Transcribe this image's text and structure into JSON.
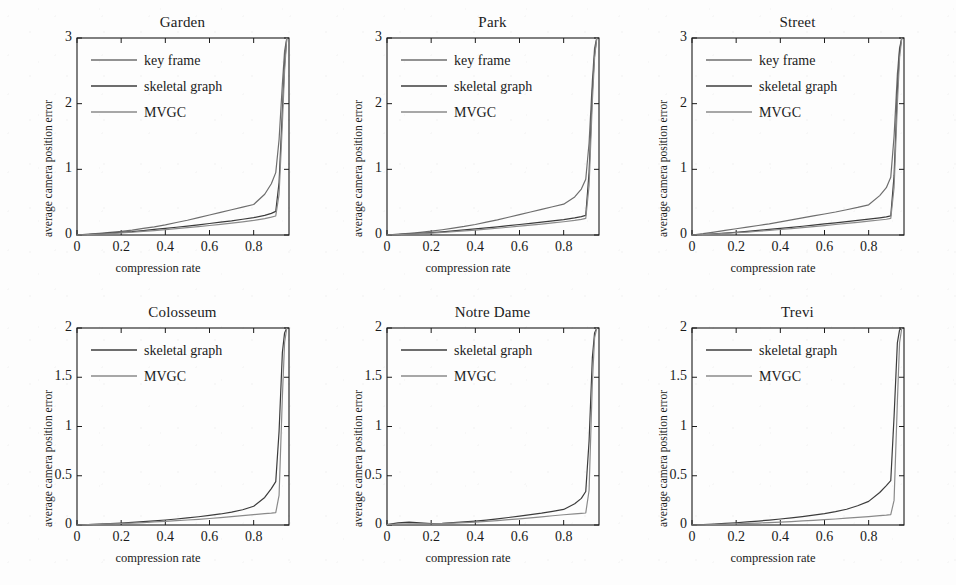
{
  "figure": {
    "background": "#fdfdfd",
    "axis_color": "#1b1b1b",
    "text_color": "#1b1b1b",
    "rows": 2,
    "cols": 3
  },
  "common": {
    "xlabel": "compression rate",
    "ylabel": "average camera position error",
    "xticks": [
      "0",
      "0.2",
      "0.4",
      "0.6",
      "0.8"
    ],
    "xtick_values": [
      0,
      0.2,
      0.4,
      0.6,
      0.8
    ],
    "xlim": [
      0,
      0.96
    ]
  },
  "series_styles": {
    "key frame": "#6e6e6e",
    "skeletal graph": "#3c3c3c",
    "MVGC": "#8a8a8a"
  },
  "chart_data": [
    {
      "type": "line",
      "title": "Garden",
      "xlabel": "compression rate",
      "ylabel": "average camera position error",
      "xlim": [
        0,
        0.96
      ],
      "ylim": [
        0,
        3
      ],
      "xticks": [
        0,
        0.2,
        0.4,
        0.6,
        0.8
      ],
      "xticklabels": [
        "0",
        "0.2",
        "0.4",
        "0.6",
        "0.8"
      ],
      "yticks": [
        0,
        1,
        2,
        3
      ],
      "yticklabels": [
        "0",
        "1",
        "2",
        "3"
      ],
      "grid": false,
      "legend_position": "upper-left",
      "legend": [
        "key frame",
        "skeletal graph",
        "MVGC"
      ],
      "x": [
        0,
        0.05,
        0.1,
        0.15,
        0.2,
        0.25,
        0.3,
        0.35,
        0.4,
        0.45,
        0.5,
        0.55,
        0.6,
        0.65,
        0.7,
        0.75,
        0.8,
        0.85,
        0.88,
        0.9,
        0.915,
        0.93,
        0.94,
        0.95
      ],
      "series": [
        {
          "name": "key frame",
          "values": [
            0.0,
            0.012,
            0.025,
            0.04,
            0.055,
            0.075,
            0.1,
            0.125,
            0.155,
            0.19,
            0.225,
            0.265,
            0.305,
            0.345,
            0.385,
            0.425,
            0.465,
            0.62,
            0.78,
            0.95,
            1.45,
            2.3,
            2.8,
            3.0
          ]
        },
        {
          "name": "skeletal graph",
          "values": [
            0.0,
            0.008,
            0.018,
            0.028,
            0.04,
            0.052,
            0.068,
            0.085,
            0.1,
            0.118,
            0.135,
            0.155,
            0.175,
            0.195,
            0.215,
            0.24,
            0.265,
            0.3,
            0.33,
            0.36,
            0.8,
            1.9,
            2.6,
            3.0
          ]
        },
        {
          "name": "MVGC",
          "values": [
            0.0,
            0.006,
            0.014,
            0.022,
            0.032,
            0.042,
            0.055,
            0.068,
            0.082,
            0.097,
            0.112,
            0.128,
            0.145,
            0.162,
            0.18,
            0.2,
            0.222,
            0.25,
            0.272,
            0.29,
            0.62,
            1.7,
            2.5,
            3.0
          ]
        }
      ]
    },
    {
      "type": "line",
      "title": "Park",
      "xlabel": "compression rate",
      "ylabel": "average camera position error",
      "xlim": [
        0,
        0.96
      ],
      "ylim": [
        0,
        3
      ],
      "xticks": [
        0,
        0.2,
        0.4,
        0.6,
        0.8
      ],
      "xticklabels": [
        "0",
        "0.2",
        "0.4",
        "0.6",
        "0.8"
      ],
      "yticks": [
        0,
        1,
        2,
        3
      ],
      "yticklabels": [
        "0",
        "1",
        "2",
        "3"
      ],
      "grid": false,
      "legend_position": "upper-left",
      "legend": [
        "key frame",
        "skeletal graph",
        "MVGC"
      ],
      "x": [
        0,
        0.05,
        0.1,
        0.15,
        0.2,
        0.25,
        0.3,
        0.35,
        0.4,
        0.45,
        0.5,
        0.55,
        0.6,
        0.65,
        0.7,
        0.75,
        0.8,
        0.85,
        0.88,
        0.9,
        0.915,
        0.93,
        0.94,
        0.95
      ],
      "series": [
        {
          "name": "key frame",
          "values": [
            0.0,
            0.012,
            0.025,
            0.04,
            0.058,
            0.08,
            0.105,
            0.13,
            0.16,
            0.195,
            0.23,
            0.27,
            0.31,
            0.35,
            0.39,
            0.43,
            0.47,
            0.58,
            0.7,
            0.85,
            1.4,
            2.35,
            2.85,
            3.0
          ]
        },
        {
          "name": "skeletal graph",
          "values": [
            0.0,
            0.007,
            0.016,
            0.026,
            0.036,
            0.048,
            0.062,
            0.078,
            0.092,
            0.108,
            0.125,
            0.142,
            0.16,
            0.178,
            0.196,
            0.215,
            0.235,
            0.26,
            0.28,
            0.3,
            0.95,
            2.2,
            2.75,
            3.0
          ]
        },
        {
          "name": "MVGC",
          "values": [
            0.0,
            0.005,
            0.012,
            0.02,
            0.028,
            0.038,
            0.05,
            0.062,
            0.075,
            0.089,
            0.103,
            0.118,
            0.134,
            0.15,
            0.167,
            0.184,
            0.202,
            0.222,
            0.238,
            0.252,
            0.75,
            2.05,
            2.7,
            3.0
          ]
        }
      ]
    },
    {
      "type": "line",
      "title": "Street",
      "xlabel": "compression rate",
      "ylabel": "average camera position error",
      "xlim": [
        0,
        0.96
      ],
      "ylim": [
        0,
        3
      ],
      "xticks": [
        0,
        0.2,
        0.4,
        0.6,
        0.8
      ],
      "xticklabels": [
        "0",
        "0.2",
        "0.4",
        "0.6",
        "0.8"
      ],
      "yticks": [
        0,
        1,
        2,
        3
      ],
      "yticklabels": [
        "0",
        "1",
        "2",
        "3"
      ],
      "grid": false,
      "legend_position": "upper-left",
      "legend": [
        "key frame",
        "skeletal graph",
        "MVGC"
      ],
      "x": [
        0,
        0.05,
        0.1,
        0.15,
        0.2,
        0.25,
        0.3,
        0.35,
        0.4,
        0.45,
        0.5,
        0.55,
        0.6,
        0.65,
        0.7,
        0.75,
        0.8,
        0.85,
        0.88,
        0.9,
        0.915,
        0.93,
        0.94,
        0.95
      ],
      "series": [
        {
          "name": "key frame",
          "values": [
            0.0,
            0.02,
            0.045,
            0.07,
            0.095,
            0.12,
            0.145,
            0.17,
            0.2,
            0.23,
            0.26,
            0.29,
            0.32,
            0.35,
            0.385,
            0.42,
            0.46,
            0.6,
            0.72,
            0.88,
            1.5,
            2.45,
            2.85,
            3.0
          ]
        },
        {
          "name": "skeletal graph",
          "values": [
            0.0,
            0.008,
            0.018,
            0.03,
            0.042,
            0.055,
            0.07,
            0.085,
            0.1,
            0.117,
            0.133,
            0.15,
            0.168,
            0.186,
            0.204,
            0.223,
            0.242,
            0.262,
            0.276,
            0.29,
            0.9,
            2.2,
            2.8,
            3.0
          ]
        },
        {
          "name": "MVGC",
          "values": [
            0.0,
            0.006,
            0.014,
            0.024,
            0.034,
            0.045,
            0.057,
            0.07,
            0.084,
            0.098,
            0.113,
            0.128,
            0.144,
            0.16,
            0.176,
            0.193,
            0.21,
            0.228,
            0.24,
            0.252,
            0.72,
            2.0,
            2.7,
            3.0
          ]
        }
      ]
    },
    {
      "type": "line",
      "title": "Colosseum",
      "xlabel": "compression rate",
      "ylabel": "average camera position error",
      "xlim": [
        0,
        0.96
      ],
      "ylim": [
        0,
        2
      ],
      "xticks": [
        0,
        0.2,
        0.4,
        0.6,
        0.8
      ],
      "xticklabels": [
        "0",
        "0.2",
        "0.4",
        "0.6",
        "0.8"
      ],
      "yticks": [
        0,
        0.5,
        1,
        1.5,
        2
      ],
      "yticklabels": [
        "0",
        "0.5",
        "1",
        "1.5",
        "2"
      ],
      "grid": false,
      "legend_position": "upper-left",
      "legend": [
        "skeletal graph",
        "MVGC"
      ],
      "x": [
        0,
        0.05,
        0.1,
        0.15,
        0.2,
        0.25,
        0.3,
        0.35,
        0.4,
        0.45,
        0.5,
        0.55,
        0.6,
        0.65,
        0.7,
        0.75,
        0.8,
        0.85,
        0.88,
        0.9,
        0.915,
        0.93,
        0.94,
        0.95
      ],
      "series": [
        {
          "name": "skeletal graph",
          "values": [
            0.0,
            0.004,
            0.009,
            0.014,
            0.02,
            0.027,
            0.034,
            0.042,
            0.051,
            0.061,
            0.072,
            0.084,
            0.097,
            0.112,
            0.13,
            0.155,
            0.19,
            0.28,
            0.37,
            0.44,
            0.95,
            1.75,
            1.95,
            2.0
          ]
        },
        {
          "name": "MVGC",
          "values": [
            0.0,
            0.003,
            0.007,
            0.011,
            0.015,
            0.02,
            0.025,
            0.031,
            0.037,
            0.044,
            0.051,
            0.058,
            0.066,
            0.075,
            0.085,
            0.095,
            0.105,
            0.115,
            0.12,
            0.125,
            0.3,
            1.3,
            1.85,
            2.0
          ]
        }
      ]
    },
    {
      "type": "line",
      "title": "Notre Dame",
      "xlabel": "compression rate",
      "ylabel": "average camera position error",
      "xlim": [
        0,
        0.96
      ],
      "ylim": [
        0,
        2
      ],
      "xticks": [
        0,
        0.2,
        0.4,
        0.6,
        0.8
      ],
      "xticklabels": [
        "0",
        "0.2",
        "0.4",
        "0.6",
        "0.8"
      ],
      "yticks": [
        0,
        0.5,
        1,
        1.5,
        2
      ],
      "yticklabels": [
        "0",
        "0.5",
        "1",
        "1.5",
        "2"
      ],
      "grid": false,
      "legend_position": "upper-left",
      "legend": [
        "skeletal graph",
        "MVGC"
      ],
      "x": [
        0,
        0.05,
        0.1,
        0.15,
        0.2,
        0.25,
        0.3,
        0.35,
        0.4,
        0.45,
        0.5,
        0.55,
        0.6,
        0.65,
        0.7,
        0.75,
        0.8,
        0.85,
        0.88,
        0.9,
        0.915,
        0.93,
        0.94,
        0.95
      ],
      "series": [
        {
          "name": "skeletal graph",
          "values": [
            0.005,
            0.022,
            0.03,
            0.022,
            0.015,
            0.018,
            0.024,
            0.031,
            0.04,
            0.05,
            0.062,
            0.076,
            0.09,
            0.105,
            0.12,
            0.138,
            0.158,
            0.215,
            0.27,
            0.34,
            0.85,
            1.7,
            1.95,
            2.0
          ]
        },
        {
          "name": "MVGC",
          "values": [
            0.003,
            0.008,
            0.012,
            0.012,
            0.012,
            0.015,
            0.019,
            0.024,
            0.03,
            0.037,
            0.045,
            0.054,
            0.063,
            0.073,
            0.083,
            0.094,
            0.104,
            0.113,
            0.118,
            0.122,
            0.35,
            1.45,
            1.9,
            2.0
          ]
        }
      ]
    },
    {
      "type": "line",
      "title": "Trevi",
      "xlabel": "compression rate",
      "ylabel": "average camera position error",
      "xlim": [
        0,
        0.96
      ],
      "ylim": [
        0,
        2
      ],
      "xticks": [
        0,
        0.2,
        0.4,
        0.6,
        0.8
      ],
      "xticklabels": [
        "0",
        "0.2",
        "0.4",
        "0.6",
        "0.8"
      ],
      "yticks": [
        0,
        0.5,
        1,
        1.5,
        2
      ],
      "yticklabels": [
        "0",
        "0.5",
        "1",
        "1.5",
        "2"
      ],
      "grid": false,
      "legend_position": "upper-left",
      "legend": [
        "skeletal graph",
        "MVGC"
      ],
      "x": [
        0,
        0.05,
        0.1,
        0.15,
        0.2,
        0.25,
        0.3,
        0.35,
        0.4,
        0.45,
        0.5,
        0.55,
        0.6,
        0.65,
        0.7,
        0.75,
        0.8,
        0.85,
        0.88,
        0.9,
        0.915,
        0.93,
        0.94,
        0.95
      ],
      "series": [
        {
          "name": "skeletal graph",
          "values": [
            0.0,
            0.004,
            0.01,
            0.016,
            0.023,
            0.031,
            0.04,
            0.05,
            0.061,
            0.073,
            0.086,
            0.1,
            0.115,
            0.135,
            0.16,
            0.195,
            0.24,
            0.33,
            0.4,
            0.45,
            1.1,
            1.85,
            1.98,
            2.0
          ]
        },
        {
          "name": "MVGC",
          "values": [
            0.0,
            0.002,
            0.005,
            0.008,
            0.012,
            0.016,
            0.02,
            0.025,
            0.03,
            0.035,
            0.041,
            0.047,
            0.054,
            0.061,
            0.069,
            0.077,
            0.085,
            0.095,
            0.1,
            0.105,
            0.25,
            1.25,
            1.85,
            2.0
          ]
        }
      ]
    }
  ]
}
